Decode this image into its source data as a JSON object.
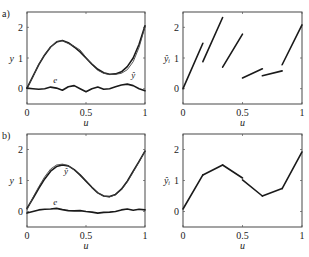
{
  "figure": {
    "panels": [
      {
        "id": "a",
        "label": "a)"
      },
      {
        "id": "b",
        "label": "b)"
      }
    ]
  },
  "chart_data": [
    {
      "panel": "a-left",
      "type": "line",
      "title": "",
      "xlabel": "u",
      "ylabel": "y",
      "xlim": [
        0,
        1
      ],
      "ylim": [
        -0.5,
        2.5
      ],
      "xticks": [
        0,
        0.5,
        1
      ],
      "xtick_labels": [
        "0",
        "0.5",
        "1"
      ],
      "yticks": [
        0,
        1,
        2
      ],
      "ytick_labels": [
        "0",
        "1",
        "2"
      ],
      "grid": false,
      "annotations": [
        {
          "text": "ŷ",
          "x": 0.9,
          "y": 0.35
        },
        {
          "text": "e",
          "x": 0.24,
          "y": 0.17
        }
      ],
      "series": [
        {
          "name": "y",
          "x": [
            0,
            0.05,
            0.1,
            0.15,
            0.2,
            0.25,
            0.3,
            0.35,
            0.4,
            0.45,
            0.5,
            0.55,
            0.6,
            0.65,
            0.7,
            0.75,
            0.8,
            0.85,
            0.9,
            0.95,
            1.0
          ],
          "values": [
            0.02,
            0.4,
            0.78,
            1.1,
            1.36,
            1.52,
            1.57,
            1.5,
            1.36,
            1.2,
            1.0,
            0.8,
            0.63,
            0.52,
            0.47,
            0.48,
            0.55,
            0.72,
            1.0,
            1.45,
            2.05
          ]
        },
        {
          "name": "ŷ",
          "x": [
            0,
            0.05,
            0.1,
            0.15,
            0.2,
            0.25,
            0.3,
            0.35,
            0.4,
            0.45,
            0.5,
            0.55,
            0.6,
            0.65,
            0.7,
            0.75,
            0.8,
            0.85,
            0.9,
            0.95,
            1.0
          ],
          "values": [
            0.0,
            0.38,
            0.8,
            1.12,
            1.35,
            1.54,
            1.56,
            1.47,
            1.38,
            1.26,
            1.02,
            0.78,
            0.6,
            0.5,
            0.46,
            0.47,
            0.5,
            0.62,
            0.88,
            1.35,
            2.02
          ]
        },
        {
          "name": "e",
          "x": [
            0,
            0.05,
            0.1,
            0.15,
            0.2,
            0.25,
            0.3,
            0.35,
            0.4,
            0.45,
            0.5,
            0.55,
            0.6,
            0.65,
            0.7,
            0.75,
            0.8,
            0.85,
            0.9,
            0.95,
            1.0
          ],
          "values": [
            0.02,
            0.0,
            -0.02,
            0.0,
            0.05,
            0.02,
            -0.05,
            0.06,
            0.1,
            0.0,
            -0.1,
            0.0,
            0.05,
            -0.02,
            0.0,
            0.06,
            0.12,
            0.15,
            0.1,
            0.0,
            -0.07
          ]
        }
      ]
    },
    {
      "panel": "a-right",
      "type": "line",
      "title": "",
      "xlabel": "u",
      "ylabel": "ŷᵢ",
      "xlim": [
        0,
        1
      ],
      "ylim": [
        -0.5,
        2.5
      ],
      "xticks": [
        0,
        0.5,
        1
      ],
      "xtick_labels": [
        "0",
        "0.5",
        "1"
      ],
      "yticks": [
        0,
        1,
        2
      ],
      "ytick_labels": [
        "0",
        "1",
        "2"
      ],
      "grid": false,
      "segments": [
        {
          "x": [
            0.0,
            0.167
          ],
          "values": [
            0.0,
            1.48
          ]
        },
        {
          "x": [
            0.167,
            0.333
          ],
          "values": [
            0.88,
            2.32
          ]
        },
        {
          "x": [
            0.333,
            0.5
          ],
          "values": [
            0.7,
            1.78
          ]
        },
        {
          "x": [
            0.5,
            0.667
          ],
          "values": [
            0.35,
            0.65
          ]
        },
        {
          "x": [
            0.667,
            0.833
          ],
          "values": [
            0.42,
            0.58
          ]
        },
        {
          "x": [
            0.833,
            1.0
          ],
          "values": [
            0.78,
            2.08
          ]
        }
      ]
    },
    {
      "panel": "b-left",
      "type": "line",
      "title": "",
      "xlabel": "u",
      "ylabel": "y",
      "xlim": [
        0,
        1
      ],
      "ylim": [
        -0.5,
        2.5
      ],
      "xticks": [
        0,
        0.5,
        1
      ],
      "xtick_labels": [
        "0",
        "0.5",
        "1"
      ],
      "yticks": [
        0,
        1,
        2
      ],
      "ytick_labels": [
        "0",
        "1",
        "2"
      ],
      "grid": false,
      "annotations": [
        {
          "text": "ŷ",
          "x": 0.33,
          "y": 1.2
        },
        {
          "text": "e",
          "x": 0.24,
          "y": 0.22
        }
      ],
      "series": [
        {
          "name": "y",
          "x": [
            0,
            0.05,
            0.1,
            0.15,
            0.2,
            0.25,
            0.3,
            0.35,
            0.4,
            0.45,
            0.5,
            0.55,
            0.6,
            0.65,
            0.7,
            0.75,
            0.8,
            0.85,
            0.9,
            0.95,
            1.0
          ],
          "values": [
            0.1,
            0.42,
            0.75,
            1.05,
            1.3,
            1.45,
            1.5,
            1.47,
            1.35,
            1.18,
            0.98,
            0.78,
            0.6,
            0.5,
            0.48,
            0.55,
            0.72,
            0.98,
            1.3,
            1.62,
            1.95
          ]
        },
        {
          "name": "ŷ",
          "x": [
            0,
            0.05,
            0.1,
            0.15,
            0.2,
            0.25,
            0.3,
            0.35,
            0.4,
            0.45,
            0.5,
            0.55,
            0.6,
            0.65,
            0.7,
            0.75,
            0.8,
            0.85,
            0.9,
            0.95,
            1.0
          ],
          "values": [
            0.05,
            0.45,
            0.8,
            1.12,
            1.37,
            1.5,
            1.53,
            1.48,
            1.34,
            1.16,
            0.96,
            0.77,
            0.6,
            0.5,
            0.47,
            0.54,
            0.7,
            0.95,
            1.27,
            1.6,
            1.95
          ]
        },
        {
          "name": "e",
          "x": [
            0,
            0.05,
            0.1,
            0.15,
            0.2,
            0.25,
            0.3,
            0.35,
            0.4,
            0.45,
            0.5,
            0.55,
            0.6,
            0.65,
            0.7,
            0.75,
            0.8,
            0.85,
            0.9,
            0.95,
            1.0
          ],
          "values": [
            -0.05,
            0.0,
            0.05,
            0.07,
            0.08,
            0.1,
            0.06,
            0.03,
            0.02,
            0.03,
            0.0,
            -0.02,
            -0.05,
            -0.03,
            -0.02,
            0.0,
            0.05,
            0.08,
            0.04,
            0.07,
            0.05
          ]
        }
      ]
    },
    {
      "panel": "b-right",
      "type": "line",
      "title": "",
      "xlabel": "u",
      "ylabel": "ŷᵢ",
      "xlim": [
        0,
        1
      ],
      "ylim": [
        -0.5,
        2.5
      ],
      "xticks": [
        0,
        0.5,
        1
      ],
      "xtick_labels": [
        "0",
        "0.5",
        "1"
      ],
      "yticks": [
        0,
        1,
        2
      ],
      "ytick_labels": [
        "0",
        "1",
        "2"
      ],
      "grid": false,
      "segments": [
        {
          "x": [
            0.0,
            0.167
          ],
          "values": [
            0.08,
            1.18
          ]
        },
        {
          "x": [
            0.167,
            0.333
          ],
          "values": [
            1.18,
            1.5
          ]
        },
        {
          "x": [
            0.333,
            0.5
          ],
          "values": [
            1.5,
            1.08
          ]
        },
        {
          "x": [
            0.5,
            0.667
          ],
          "values": [
            1.02,
            0.5
          ]
        },
        {
          "x": [
            0.667,
            0.833
          ],
          "values": [
            0.5,
            0.74
          ]
        },
        {
          "x": [
            0.833,
            1.0
          ],
          "values": [
            0.74,
            1.92
          ]
        }
      ]
    }
  ],
  "layout": {
    "panels": [
      {
        "left": 27,
        "right": 145,
        "top": 12,
        "bottom": 104
      },
      {
        "left": 183,
        "right": 302,
        "top": 12,
        "bottom": 104
      },
      {
        "left": 27,
        "right": 145,
        "top": 134,
        "bottom": 227
      },
      {
        "left": 183,
        "right": 302,
        "top": 134,
        "bottom": 227
      }
    ]
  }
}
